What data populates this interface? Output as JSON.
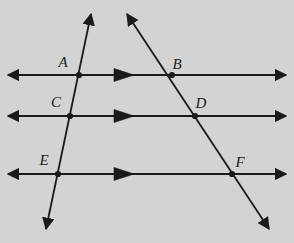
{
  "figure": {
    "name": "three-parallel-lines-two-transversals",
    "background_color": "#d3d3d3",
    "stroke_color": "#1a1a1a",
    "width": 294,
    "height": 243
  },
  "parallel_lines": [
    {
      "id": "top-parallel-line",
      "y": 75,
      "x_start": 8,
      "x_end": 286,
      "tick_marker_x": 125,
      "tick_marker_label": "single-arrow-marker"
    },
    {
      "id": "middle-parallel-line",
      "y": 116,
      "x_start": 8,
      "x_end": 286,
      "tick_marker_x": 125,
      "tick_marker_label": "single-arrow-marker"
    },
    {
      "id": "bottom-parallel-line",
      "y": 174,
      "x_start": 8,
      "x_end": 286,
      "tick_marker_x": 125,
      "tick_marker_label": "single-arrow-marker"
    }
  ],
  "transversals": [
    {
      "id": "left-transversal",
      "x1": 91,
      "y1": 14,
      "x2": 46,
      "y2": 229
    },
    {
      "id": "right-transversal",
      "x1": 127,
      "y1": 14,
      "x2": 269,
      "y2": 229
    }
  ],
  "points": [
    {
      "label": "A",
      "x": 79,
      "y": 75,
      "label_x": 63,
      "label_y": 62
    },
    {
      "label": "B",
      "x": 172,
      "y": 75,
      "label_x": 177,
      "label_y": 64
    },
    {
      "label": "C",
      "x": 70,
      "y": 116,
      "label_x": 56,
      "label_y": 102
    },
    {
      "label": "D",
      "x": 195,
      "y": 116,
      "label_x": 201,
      "label_y": 103
    },
    {
      "label": "E",
      "x": 58,
      "y": 174,
      "label_x": 44,
      "label_y": 160
    },
    {
      "label": "F",
      "x": 232,
      "y": 174,
      "label_x": 240,
      "label_y": 162
    }
  ]
}
